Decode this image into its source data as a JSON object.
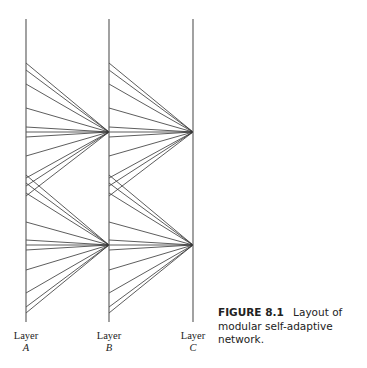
{
  "figure": {
    "number": "FIGURE 8.1",
    "caption": "Layout of modular self-adaptive network."
  },
  "layers": [
    {
      "name": "Layer",
      "letter": "A",
      "x": 26
    },
    {
      "name": "Layer",
      "letter": "B",
      "x": 109
    },
    {
      "name": "Layer",
      "letter": "C",
      "x": 193
    }
  ],
  "geometry": {
    "line_top": 19,
    "line_bottom": 322,
    "line_color": "#555555",
    "edge_color": "#333333"
  },
  "modules": [
    {
      "converge_y": 132,
      "source_ys": [
        63,
        70,
        84,
        108,
        127,
        132,
        137,
        156,
        178,
        186,
        196
      ]
    },
    {
      "converge_y": 245,
      "source_ys": [
        175,
        183,
        193,
        222,
        240,
        245,
        250,
        270,
        293,
        307,
        313
      ]
    }
  ]
}
